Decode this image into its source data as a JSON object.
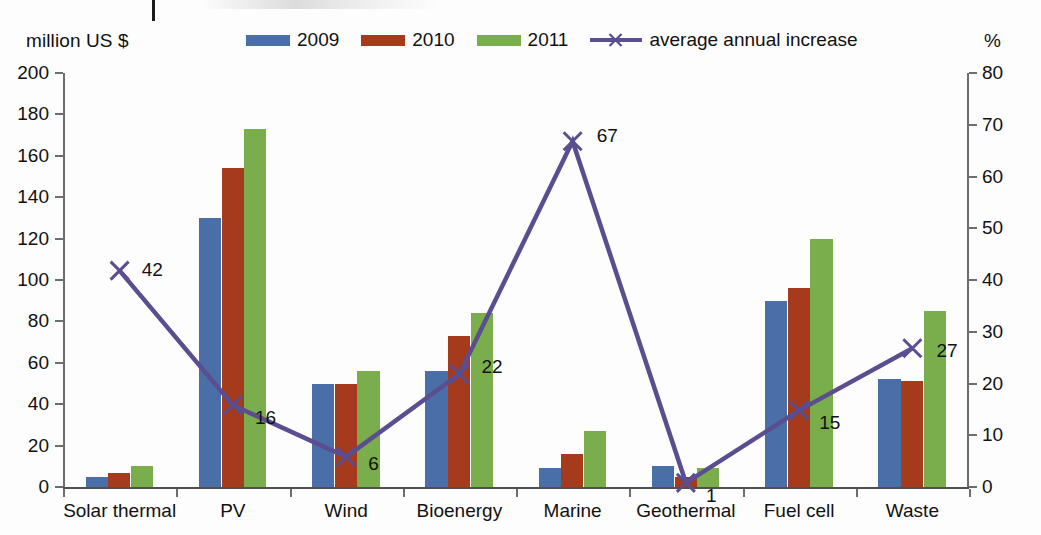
{
  "chart_data": {
    "type": "bar",
    "title": "",
    "subtitle": "",
    "categories": [
      "Solar thermal",
      "PV",
      "Wind",
      "Bioenergy",
      "Marine",
      "Geothermal",
      "Fuel cell",
      "Waste"
    ],
    "series": [
      {
        "name": "2009",
        "type": "bar",
        "axis": "left",
        "color": "#4a6fa8",
        "values": [
          5,
          130,
          50,
          56,
          9,
          10,
          90,
          52
        ]
      },
      {
        "name": "2010",
        "type": "bar",
        "axis": "left",
        "color": "#a53a1c",
        "values": [
          7,
          154,
          50,
          73,
          16,
          5,
          96,
          51
        ]
      },
      {
        "name": "2011",
        "type": "bar",
        "axis": "left",
        "color": "#7aae4c",
        "values": [
          10,
          173,
          56,
          84,
          27,
          9,
          120,
          85
        ]
      },
      {
        "name": "average annual increase",
        "type": "line",
        "axis": "right",
        "color": "#5b4e90",
        "marker": "x",
        "values": [
          42,
          16,
          6,
          22,
          67,
          1,
          15,
          27
        ]
      }
    ],
    "line_point_labels": [
      "42",
      "16",
      "6",
      "22",
      "67",
      "1",
      "15",
      "27"
    ],
    "xlabel": "",
    "ylabel_left": "million US $",
    "ylabel_right": "%",
    "ylim_left": [
      0,
      200
    ],
    "ytick_left": [
      0,
      20,
      40,
      60,
      80,
      100,
      120,
      140,
      160,
      180,
      200
    ],
    "ylim_right": [
      0,
      80
    ],
    "ytick_right": [
      0,
      10,
      20,
      30,
      40,
      50,
      60,
      70,
      80
    ],
    "grid": false,
    "legend_position": "top"
  },
  "legend": {
    "items": [
      {
        "label": "2009",
        "color": "#4a6fa8",
        "marker": "swatch"
      },
      {
        "label": "2010",
        "color": "#a53a1c",
        "marker": "swatch"
      },
      {
        "label": "2011",
        "color": "#7aae4c",
        "marker": "swatch"
      },
      {
        "label": "average annual increase",
        "color": "#5b4e90",
        "marker": "line-x"
      }
    ]
  },
  "axis_titles": {
    "left": "million US $",
    "right": "%"
  }
}
